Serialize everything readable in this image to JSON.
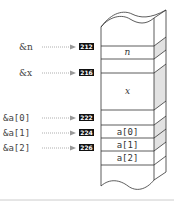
{
  "diagram": {
    "pointers": [
      {
        "label": "&n",
        "address": "212"
      },
      {
        "label": "&x",
        "address": "216"
      },
      {
        "label": "&a[0]",
        "address": "222"
      },
      {
        "label": "&a[1]",
        "address": "224"
      },
      {
        "label": "&a[2]",
        "address": "226"
      }
    ],
    "cells": [
      {
        "label": "n"
      },
      {
        "label": "x"
      },
      {
        "label": "a[0]"
      },
      {
        "label": "a[1]"
      },
      {
        "label": "a[2]"
      }
    ],
    "colors": {
      "stroke": "#333333",
      "side_shade": "#e2e2e2",
      "address_bg": "#111111",
      "arrow": "#999999",
      "rule": "#cccccc"
    }
  }
}
